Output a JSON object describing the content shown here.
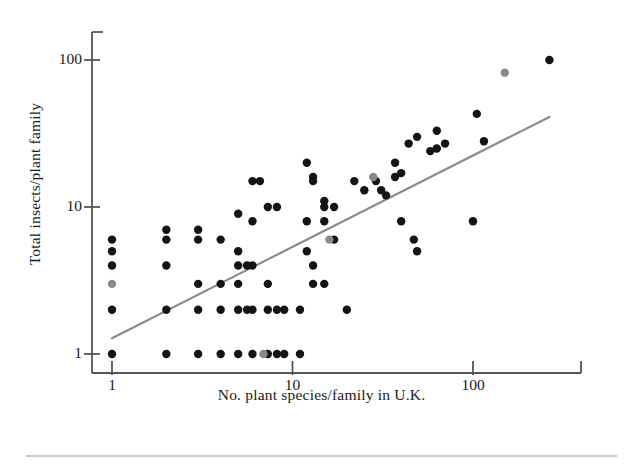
{
  "figure": {
    "clipped_header_text": "",
    "caption_rule": true
  },
  "chart_data": {
    "type": "scatter",
    "title": "",
    "xlabel": "No. plant species/family in U.K.",
    "ylabel": "Total insects/plant family",
    "xscale": "log",
    "yscale": "log",
    "xlim": [
      0.85,
      330
    ],
    "ylim": [
      0.82,
      170
    ],
    "xticks": [
      1,
      10,
      100
    ],
    "xticklabels": [
      "1",
      "10",
      "100"
    ],
    "yticks": [
      1,
      10,
      100
    ],
    "yticklabels": [
      "1",
      "10",
      "100"
    ],
    "grid": false,
    "legend": null,
    "colors": {
      "point_black": "#141414",
      "point_gray": "#8a8a8a",
      "trendline": "#8a8a8a",
      "axis": "#555555",
      "text": "#1a1a1a"
    },
    "marker_radius_px": 4.2,
    "trendline": {
      "x1": 1.0,
      "y1": 1.28,
      "x2": 265.0,
      "y2": 41.0,
      "width_px": 2.2
    },
    "series": [
      {
        "name": "black points",
        "color": "#141414",
        "points": [
          [
            1,
            6
          ],
          [
            1,
            5
          ],
          [
            1,
            4
          ],
          [
            1,
            2
          ],
          [
            1,
            1
          ],
          [
            2,
            7
          ],
          [
            2,
            6
          ],
          [
            2,
            4
          ],
          [
            2,
            2
          ],
          [
            2,
            1
          ],
          [
            3,
            7
          ],
          [
            3,
            6
          ],
          [
            3,
            3
          ],
          [
            3,
            2
          ],
          [
            3,
            1
          ],
          [
            4,
            6
          ],
          [
            4,
            3
          ],
          [
            4,
            2
          ],
          [
            4,
            1
          ],
          [
            5,
            9
          ],
          [
            5,
            5
          ],
          [
            5,
            4
          ],
          [
            5,
            3
          ],
          [
            5,
            2
          ],
          [
            5,
            1
          ],
          [
            5.6,
            4
          ],
          [
            5.6,
            2
          ],
          [
            6,
            15
          ],
          [
            6,
            8
          ],
          [
            6,
            4
          ],
          [
            6,
            2
          ],
          [
            6,
            1
          ],
          [
            6.6,
            15
          ],
          [
            7.3,
            10
          ],
          [
            7.3,
            3
          ],
          [
            7.3,
            2
          ],
          [
            7.3,
            1
          ],
          [
            8.2,
            10
          ],
          [
            8.2,
            2
          ],
          [
            8.2,
            1
          ],
          [
            9,
            2
          ],
          [
            9,
            1
          ],
          [
            11,
            2
          ],
          [
            11,
            1
          ],
          [
            12,
            20
          ],
          [
            12,
            8
          ],
          [
            12,
            5
          ],
          [
            13,
            16
          ],
          [
            13,
            15
          ],
          [
            13,
            4
          ],
          [
            13,
            3
          ],
          [
            15,
            11
          ],
          [
            15,
            10
          ],
          [
            15,
            8
          ],
          [
            15,
            3
          ],
          [
            17,
            10
          ],
          [
            17,
            6
          ],
          [
            20,
            2
          ],
          [
            22,
            15
          ],
          [
            25,
            13
          ],
          [
            29,
            15
          ],
          [
            31,
            13
          ],
          [
            33,
            12
          ],
          [
            37,
            20
          ],
          [
            37,
            16
          ],
          [
            40,
            17
          ],
          [
            40,
            8
          ],
          [
            44,
            27
          ],
          [
            47,
            6
          ],
          [
            49,
            30
          ],
          [
            49,
            5
          ],
          [
            58,
            24
          ],
          [
            63,
            33
          ],
          [
            63,
            25
          ],
          [
            70,
            27
          ],
          [
            100,
            8
          ],
          [
            105,
            43
          ],
          [
            115,
            28
          ],
          [
            265,
            100
          ]
        ]
      },
      {
        "name": "gray points",
        "color": "#8a8a8a",
        "points": [
          [
            1,
            3
          ],
          [
            6.9,
            1
          ],
          [
            16,
            6
          ],
          [
            28,
            16
          ],
          [
            150,
            82
          ]
        ]
      }
    ]
  }
}
